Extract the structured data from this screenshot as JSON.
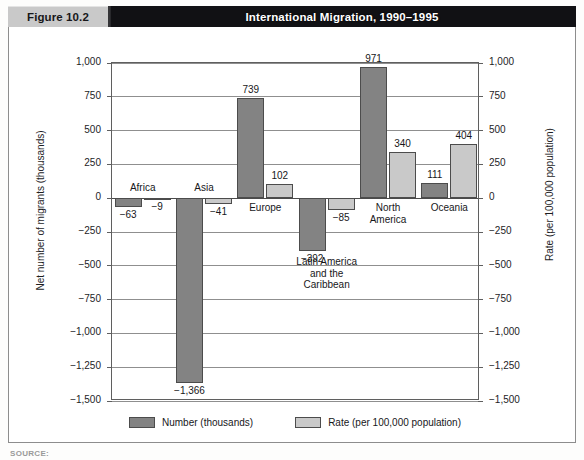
{
  "header": {
    "figure_number": "Figure 10.2",
    "title": "International Migration, 1990–1995"
  },
  "source_note": "SOURCE:",
  "colors": {
    "number_bar": "#838383",
    "rate_bar": "#c9c9c9",
    "header_band": "#111114",
    "figure_box": "#c9c9c9",
    "axis": "#5f5f5f",
    "gridline": "#8f8f8f"
  },
  "legend": {
    "position": "bottom-center",
    "items": [
      {
        "label": "Number (thousands)",
        "swatch": "number"
      },
      {
        "label": "Rate (per 100,000 population)",
        "swatch": "rate"
      }
    ]
  },
  "axes": {
    "left_title": "Net number of migrants (thousands)",
    "right_title": "Rate (per 100,000 population)",
    "ticks": [
      "1,000",
      "750",
      "500",
      "250",
      "0",
      "−250",
      "−500",
      "−750",
      "−1,000",
      "−1,250",
      "−1,500"
    ]
  },
  "chart_data": {
    "type": "bar",
    "title": "International Migration, 1990–1995",
    "xlabel": "",
    "ylabel": "Net number of migrants (thousands)",
    "y2label": "Rate (per 100,000 population)",
    "ylim": [
      -1500,
      1000
    ],
    "y2lim": [
      -1500,
      1000
    ],
    "ytick_values": [
      1000,
      750,
      500,
      250,
      0,
      -250,
      -500,
      -750,
      -1000,
      -1250,
      -1500
    ],
    "grid": true,
    "legend": [
      "Number (thousands)",
      "Rate (per 100,000 population)"
    ],
    "categories": [
      "Africa",
      "Asia",
      "Europe",
      "Latin America and the Caribbean",
      "North America",
      "Oceania"
    ],
    "category_display": [
      [
        "Africa"
      ],
      [
        "Asia"
      ],
      [
        "Europe"
      ],
      [
        "Latin America",
        "and the",
        "Caribbean"
      ],
      [
        "North",
        "America"
      ],
      [
        "Oceania"
      ]
    ],
    "series": [
      {
        "name": "Number (thousands)",
        "axis": "left",
        "values": [
          -63,
          -1366,
          739,
          -392,
          971,
          111
        ],
        "labels": [
          "−63",
          "−1,366",
          "739",
          "−392",
          "971",
          "111"
        ]
      },
      {
        "name": "Rate (per 100,000 population)",
        "axis": "right",
        "values": [
          -9,
          -41,
          102,
          -85,
          340,
          404
        ],
        "labels": [
          "−9",
          "−41",
          "102",
          "−85",
          "340",
          "404"
        ]
      }
    ]
  }
}
